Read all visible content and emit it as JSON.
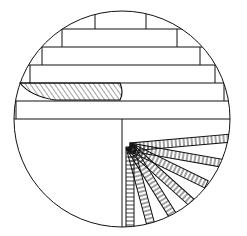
{
  "diagram": {
    "stroke": "#111111",
    "background": "#ffffff",
    "circle": {
      "cx": 122,
      "cy": 119,
      "r": 108
    },
    "courses_y": [
      29,
      47,
      65,
      83,
      101,
      119
    ],
    "course_left_x": [
      95,
      62,
      42,
      30,
      19,
      14
    ],
    "course_right_x": [
      146,
      177,
      200,
      215,
      224,
      230
    ],
    "vertical_divider_x": 122,
    "fan_ray_count": 7
  }
}
